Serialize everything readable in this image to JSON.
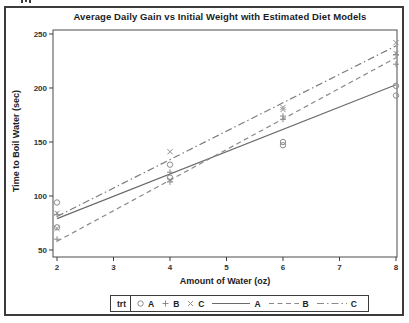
{
  "figure": {
    "title": "Average Daily Gain vs Initial Weight with Estimated Diet Models"
  },
  "chart_data": {
    "type": "scatter",
    "title": "Average Daily Gain vs Initial Weight with Estimated Diet Models",
    "xlabel": "Amount of Water (oz)",
    "ylabel": "Time to Boil Water (sec)",
    "xlim": [
      1.929,
      8.018
    ],
    "ylim": [
      43.5,
      253.7
    ],
    "x_ticks": [
      2,
      3,
      4,
      5,
      6,
      7,
      8
    ],
    "y_ticks": [
      50,
      100,
      150,
      200,
      250
    ],
    "grid": false,
    "legend_position": "bottom",
    "legend_title": "trt",
    "series": [
      {
        "name": "A",
        "marker": "circle",
        "marker_color": "#8c8c8c",
        "points": [
          [
            2,
            94
          ],
          [
            2,
            71
          ],
          [
            4,
            129
          ],
          [
            4,
            117
          ],
          [
            6,
            150
          ],
          [
            6,
            147
          ],
          [
            8,
            202
          ],
          [
            8,
            193
          ]
        ],
        "fit_line": {
          "style": "solid",
          "color": "#6b6b6b",
          "from": [
            2,
            79
          ],
          "to": [
            8,
            203
          ]
        }
      },
      {
        "name": "B",
        "marker": "plus",
        "marker_color": "#8c8c8c",
        "points": [
          [
            2,
            83
          ],
          [
            2,
            60
          ],
          [
            4,
            122
          ],
          [
            4,
            113
          ],
          [
            6,
            174
          ],
          [
            6,
            171
          ],
          [
            8,
            231
          ],
          [
            8,
            222
          ]
        ],
        "fit_line": {
          "style": "dashed",
          "color": "#8a8a8a",
          "from": [
            2,
            58
          ],
          "to": [
            8,
            228
          ]
        }
      },
      {
        "name": "C",
        "marker": "cross",
        "marker_color": "#8c8c8c",
        "points": [
          [
            2,
            84
          ],
          [
            2,
            70
          ],
          [
            4,
            141
          ],
          [
            4,
            115
          ],
          [
            6,
            182
          ],
          [
            6,
            180
          ],
          [
            8,
            242
          ],
          [
            8,
            232
          ]
        ],
        "fit_line": {
          "style": "dashdot",
          "color": "#7d7d7d",
          "from": [
            2,
            81
          ],
          "to": [
            8,
            239
          ]
        }
      }
    ]
  },
  "legend": {
    "title": "trt",
    "marker_items": [
      {
        "label": "A",
        "marker": "circle"
      },
      {
        "label": "B",
        "marker": "plus"
      },
      {
        "label": "C",
        "marker": "cross"
      }
    ],
    "line_items": [
      {
        "label": "A",
        "style": "solid"
      },
      {
        "label": "B",
        "style": "dashed"
      },
      {
        "label": "C",
        "style": "dashdot"
      }
    ]
  }
}
